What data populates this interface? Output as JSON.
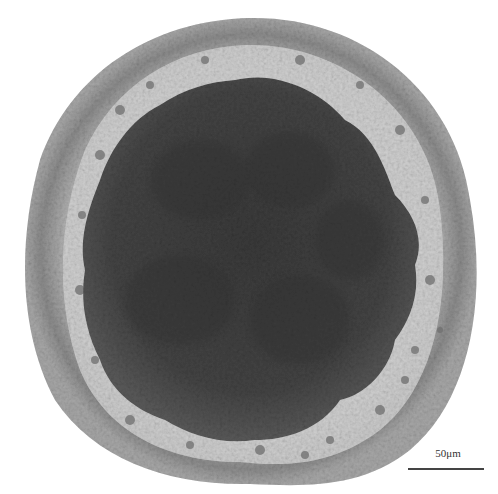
{
  "image": {
    "subject": "cross-section micrograph of a circular tissue specimen",
    "description": "Grayscale light micrograph: outer ring of small densely packed cells, pale intermediate zone with scattered nuclei, large dark lobed central mass",
    "colors": {
      "background": "#ffffff",
      "outer_ring": "#8a8a8a",
      "pale_zone": "#d9d9d9",
      "central_mass": "#3a3a3a"
    }
  },
  "scale_bar": {
    "label": "50μm"
  }
}
